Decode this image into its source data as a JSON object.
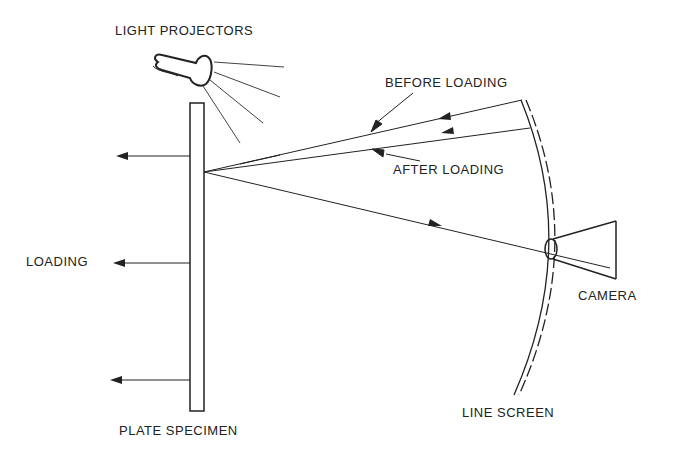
{
  "diagram": {
    "labels": {
      "light_projectors": "LIGHT PROJECTORS",
      "before_loading": "BEFORE LOADING",
      "after_loading": "AFTER LOADING",
      "loading": "LOADING",
      "camera": "CAMERA",
      "plate_specimen": "PLATE SPECIMEN",
      "line_screen": "LINE SCREEN"
    },
    "colors": {
      "stroke": "#222222",
      "background": "#ffffff"
    }
  }
}
